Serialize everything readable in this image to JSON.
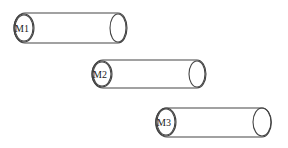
{
  "diagram": {
    "type": "cylinders",
    "stroke_color": "#444444",
    "background": "#ffffff",
    "cylinders": [
      {
        "label": "M1",
        "x1": 25,
        "x2": 118,
        "cy": 28,
        "ry": 15
      },
      {
        "label": "M2",
        "x1": 103,
        "x2": 197,
        "cy": 73,
        "ry": 14
      },
      {
        "label": "M3",
        "x1": 167,
        "x2": 262,
        "cy": 122,
        "ry": 14
      }
    ]
  }
}
